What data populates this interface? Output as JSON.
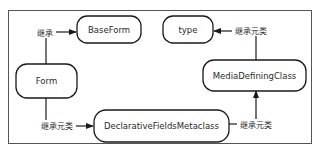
{
  "diagram": {
    "nodes": [
      {
        "id": "baseform",
        "label": "BaseForm"
      },
      {
        "id": "type",
        "label": "type"
      },
      {
        "id": "form",
        "label": "Form"
      },
      {
        "id": "mediadefiningclass",
        "label": "MediaDefiningClass"
      },
      {
        "id": "declarativefieldsmetaclass",
        "label": "DeclarativeFieldsMetaclass"
      }
    ],
    "edges": [
      {
        "from": "form",
        "to": "baseform",
        "label": "继承"
      },
      {
        "from": "mediadefiningclass",
        "to": "type",
        "label": "继承元类"
      },
      {
        "from": "form",
        "to": "declarativefieldsmetaclass",
        "label": "继承元类"
      },
      {
        "from": "declarativefieldsmetaclass",
        "to": "mediadefiningclass",
        "label": "继承元类"
      }
    ]
  }
}
